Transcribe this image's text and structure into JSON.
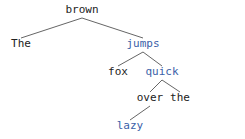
{
  "tree": {
    "nodes": [
      {
        "id": "brown",
        "label": "brown",
        "color": "#222222"
      },
      {
        "id": "the1",
        "label": "The",
        "color": "#222222"
      },
      {
        "id": "jumps",
        "label": "jumps",
        "color": "#3b5fa8"
      },
      {
        "id": "fox",
        "label": "fox",
        "color": "#222222"
      },
      {
        "id": "quick",
        "label": "quick",
        "color": "#3b5fa8"
      },
      {
        "id": "over",
        "label": "over",
        "color": "#222222"
      },
      {
        "id": "the2",
        "label": "the",
        "color": "#222222"
      },
      {
        "id": "lazy",
        "label": "lazy",
        "color": "#3b5fa8"
      }
    ],
    "edges": [
      {
        "from": "brown",
        "to": "the1"
      },
      {
        "from": "brown",
        "to": "jumps"
      },
      {
        "from": "jumps",
        "to": "fox"
      },
      {
        "from": "jumps",
        "to": "quick"
      },
      {
        "from": "quick",
        "to": "over"
      },
      {
        "from": "quick",
        "to": "the2"
      },
      {
        "from": "over",
        "to": "lazy"
      }
    ],
    "edge_color": "#666666"
  }
}
